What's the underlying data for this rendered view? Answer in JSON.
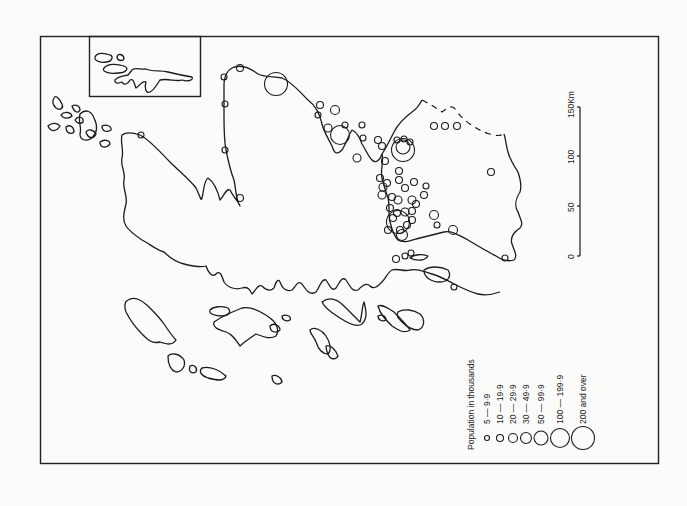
{
  "map": {
    "legend": {
      "title": "Population in thousands",
      "entries": [
        {
          "label": "5 — 9·9",
          "radius": 2.5
        },
        {
          "label": "10 — 19·9",
          "radius": 3.5
        },
        {
          "label": "20 — 29·9",
          "radius": 4.5
        },
        {
          "label": "30 — 49·9",
          "radius": 5.5
        },
        {
          "label": "50 — 99·9",
          "radius": 7
        },
        {
          "label": "100 — 199·9",
          "radius": 9.5
        },
        {
          "label": "200 and over",
          "radius": 11.5
        }
      ]
    },
    "scale_bar": {
      "unit": "Km",
      "ticks": [
        "0",
        "50",
        "100",
        "150Km"
      ]
    },
    "colors": {
      "ink": "#1c1c1c",
      "paper": "#fbfbfa"
    },
    "cities": [
      {
        "x": 276,
        "y": 84,
        "r": 11.5
      },
      {
        "x": 340,
        "y": 135,
        "r": 9.5
      },
      {
        "x": 403,
        "y": 150,
        "r": 11.5
      },
      {
        "x": 403,
        "y": 147,
        "r": 7
      },
      {
        "x": 398,
        "y": 222,
        "r": 11.5
      },
      {
        "x": 240,
        "y": 68,
        "r": 3.5
      },
      {
        "x": 224,
        "y": 77,
        "r": 3
      },
      {
        "x": 225,
        "y": 104,
        "r": 3
      },
      {
        "x": 225,
        "y": 150,
        "r": 3
      },
      {
        "x": 240,
        "y": 198,
        "r": 3.5
      },
      {
        "x": 141,
        "y": 135,
        "r": 3
      },
      {
        "x": 320,
        "y": 105,
        "r": 3.5
      },
      {
        "x": 335,
        "y": 110,
        "r": 4.5
      },
      {
        "x": 318,
        "y": 115,
        "r": 3
      },
      {
        "x": 328,
        "y": 128,
        "r": 4
      },
      {
        "x": 345,
        "y": 125,
        "r": 3
      },
      {
        "x": 362,
        "y": 125,
        "r": 3
      },
      {
        "x": 363,
        "y": 138,
        "r": 3
      },
      {
        "x": 378,
        "y": 140,
        "r": 3.5
      },
      {
        "x": 382,
        "y": 146,
        "r": 3.5
      },
      {
        "x": 357,
        "y": 158,
        "r": 4
      },
      {
        "x": 385,
        "y": 161,
        "r": 3.5
      },
      {
        "x": 397,
        "y": 140,
        "r": 3
      },
      {
        "x": 404,
        "y": 139,
        "r": 3
      },
      {
        "x": 410,
        "y": 142,
        "r": 3
      },
      {
        "x": 380,
        "y": 178,
        "r": 3.5
      },
      {
        "x": 387,
        "y": 183,
        "r": 3.5
      },
      {
        "x": 399,
        "y": 171,
        "r": 3.5
      },
      {
        "x": 399,
        "y": 180,
        "r": 3.5
      },
      {
        "x": 383,
        "y": 187,
        "r": 4
      },
      {
        "x": 382,
        "y": 195,
        "r": 4
      },
      {
        "x": 405,
        "y": 188,
        "r": 3.5
      },
      {
        "x": 414,
        "y": 182,
        "r": 3.5
      },
      {
        "x": 426,
        "y": 186,
        "r": 3
      },
      {
        "x": 424,
        "y": 195,
        "r": 3.5
      },
      {
        "x": 392,
        "y": 197,
        "r": 3.5
      },
      {
        "x": 398,
        "y": 200,
        "r": 4
      },
      {
        "x": 412,
        "y": 200,
        "r": 4
      },
      {
        "x": 397,
        "y": 213,
        "r": 3.5
      },
      {
        "x": 405,
        "y": 212,
        "r": 4
      },
      {
        "x": 412,
        "y": 211,
        "r": 3.5
      },
      {
        "x": 416,
        "y": 204,
        "r": 3.5
      },
      {
        "x": 390,
        "y": 208,
        "r": 3.5
      },
      {
        "x": 393,
        "y": 218,
        "r": 3.5
      },
      {
        "x": 400,
        "y": 230,
        "r": 3.5
      },
      {
        "x": 407,
        "y": 225,
        "r": 3.5
      },
      {
        "x": 412,
        "y": 220,
        "r": 3.5
      },
      {
        "x": 388,
        "y": 230,
        "r": 3.5
      },
      {
        "x": 402,
        "y": 235,
        "r": 5.5
      },
      {
        "x": 434,
        "y": 215,
        "r": 4.5
      },
      {
        "x": 437,
        "y": 225,
        "r": 3
      },
      {
        "x": 453,
        "y": 230,
        "r": 4.5
      },
      {
        "x": 434,
        "y": 126,
        "r": 3.5
      },
      {
        "x": 445,
        "y": 126,
        "r": 3.5
      },
      {
        "x": 457,
        "y": 126,
        "r": 3.5
      },
      {
        "x": 491,
        "y": 172,
        "r": 3.5
      },
      {
        "x": 505,
        "y": 258,
        "r": 3
      },
      {
        "x": 454,
        "y": 287,
        "r": 3
      },
      {
        "x": 396,
        "y": 259,
        "r": 3.5
      },
      {
        "x": 411,
        "y": 253,
        "r": 3
      },
      {
        "x": 405,
        "y": 256,
        "r": 3
      }
    ]
  }
}
